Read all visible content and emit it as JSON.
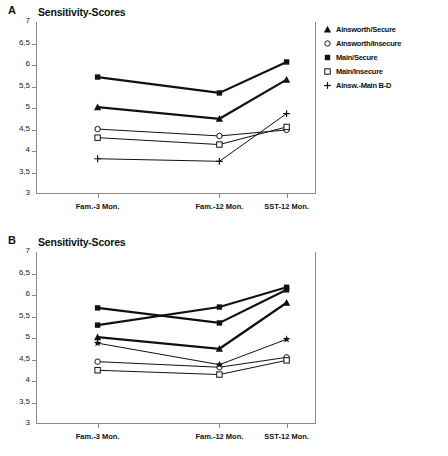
{
  "figure": {
    "panels": [
      {
        "letter": "A",
        "title": "Sensitivity-Scores",
        "legend": [
          {
            "label": "Ainsworth/Secure",
            "marker": "filled-triangle"
          },
          {
            "label": "Ainsworth/Insecure",
            "marker": "open-circle"
          },
          {
            "label": "Main/Secure",
            "marker": "filled-square"
          },
          {
            "label": "Main/Insecure",
            "marker": "open-square"
          },
          {
            "label": "Ainsw.-Main B-D",
            "marker": "plus"
          }
        ]
      },
      {
        "letter": "B",
        "title": "Sensitivity-Scores",
        "legend": [
          {
            "label": "Ainsworth/Secure",
            "marker": "filled-triangle"
          },
          {
            "label": "Ainsworth/Insecure",
            "marker": "open-circle"
          },
          {
            "label": "Main/Secure",
            "marker": "filled-square"
          },
          {
            "label": "Main/Insecure",
            "marker": "open-square"
          },
          {
            "label": "Crittenden/Secure",
            "marker": "filled-square"
          },
          {
            "label": "Crittenden/Insecure",
            "marker": "filled-star"
          }
        ]
      }
    ]
  },
  "chart_data": [
    {
      "type": "line",
      "panel": "A",
      "title": "Sensitivity-Scores",
      "xlabel": "",
      "ylabel": "",
      "categories": [
        "Fam.-3 Mon.",
        "Fam.-12 Mon.",
        "SST-12 Mon."
      ],
      "ylim": [
        3,
        7
      ],
      "yticks": [
        3,
        3.5,
        4,
        4.5,
        5,
        5.5,
        6,
        6.5,
        7
      ],
      "ytick_labels": [
        "3",
        "3,5",
        "4",
        "4,5",
        "5",
        "5,5",
        "6",
        "6,5",
        "7"
      ],
      "grid": false,
      "legend_position": "right",
      "series": [
        {
          "name": "Ainsworth/Secure",
          "marker": "filled-triangle",
          "values": [
            5.02,
            4.75,
            5.66
          ]
        },
        {
          "name": "Ainsworth/Insecure",
          "marker": "open-circle",
          "values": [
            4.51,
            4.35,
            4.49
          ]
        },
        {
          "name": "Main/Secure",
          "marker": "filled-square",
          "values": [
            5.72,
            5.35,
            6.07
          ]
        },
        {
          "name": "Main/Insecure",
          "marker": "open-square",
          "values": [
            4.31,
            4.15,
            4.56
          ]
        },
        {
          "name": "Ainsw.-Main B-D",
          "marker": "plus",
          "values": [
            3.82,
            3.76,
            4.87
          ]
        }
      ]
    },
    {
      "type": "line",
      "panel": "B",
      "title": "Sensitivity-Scores",
      "xlabel": "",
      "ylabel": "",
      "categories": [
        "Fam.-3 Mon.",
        "Fam.-12 Mon.",
        "SST-12 Mon."
      ],
      "ylim": [
        3,
        7
      ],
      "yticks": [
        3,
        3.5,
        4,
        4.5,
        5,
        5.5,
        6,
        6.5,
        7
      ],
      "ytick_labels": [
        "3",
        "3,5",
        "4",
        "4,5",
        "5",
        "5,5",
        "6",
        "6,5",
        "7"
      ],
      "grid": false,
      "legend_position": "right",
      "series": [
        {
          "name": "Ainsworth/Secure",
          "marker": "filled-triangle",
          "values": [
            5.02,
            4.75,
            5.82
          ]
        },
        {
          "name": "Ainsworth/Insecure",
          "marker": "open-circle",
          "values": [
            4.45,
            4.32,
            4.55
          ]
        },
        {
          "name": "Main/Secure",
          "marker": "filled-square",
          "values": [
            5.7,
            5.35,
            6.12
          ]
        },
        {
          "name": "Main/Insecure",
          "marker": "open-square",
          "values": [
            4.25,
            4.15,
            4.48
          ]
        },
        {
          "name": "Crittenden/Secure",
          "marker": "filled-square",
          "values": [
            5.3,
            5.72,
            6.18
          ]
        },
        {
          "name": "Crittenden/Insecure",
          "marker": "filled-star",
          "values": [
            4.88,
            4.38,
            4.97
          ]
        }
      ]
    }
  ]
}
